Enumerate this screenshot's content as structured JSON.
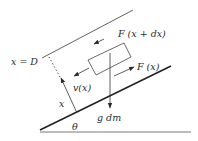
{
  "diagram": {
    "labels": {
      "x_eq_D": "x = D",
      "force_top": "F (x + dx)",
      "force_bottom": "F (x)",
      "velocity": "v(x)",
      "position": "x",
      "gravity": "g dm",
      "angle": "θ"
    },
    "colors": {
      "line": "#2b2b2b",
      "background": "#ffffff"
    }
  }
}
